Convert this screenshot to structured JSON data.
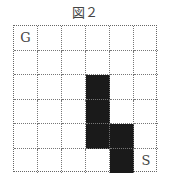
{
  "figure": {
    "title": "図２",
    "rows": 6,
    "cols": 6,
    "cells": [
      [
        "G",
        "",
        "",
        "",
        "",
        ""
      ],
      [
        "",
        "",
        "",
        "",
        "",
        ""
      ],
      [
        "",
        "",
        "",
        "#",
        "",
        ""
      ],
      [
        "",
        "",
        "",
        "#",
        "",
        ""
      ],
      [
        "",
        "",
        "",
        "#",
        "#",
        ""
      ],
      [
        "",
        "",
        "",
        "",
        "#",
        "S"
      ]
    ],
    "labels": {
      "goal": "G",
      "start": "S"
    },
    "colors": {
      "blocked": "#1a1a1a",
      "open": "#ffffff",
      "grid_line": "#777777"
    }
  }
}
